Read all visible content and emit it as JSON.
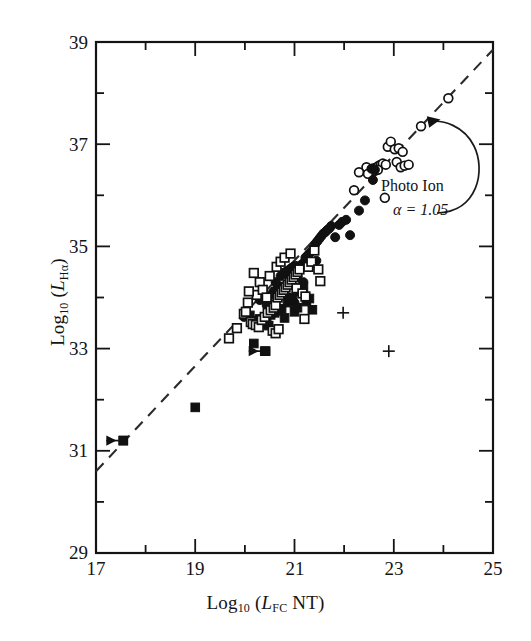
{
  "chart_data": {
    "type": "scatter",
    "title": "",
    "xlabel": "Log10 (LFC NT)",
    "ylabel": "Log10 (LHa)",
    "xlim": [
      17,
      25
    ],
    "ylim": [
      29,
      39
    ],
    "xticks_major": [
      17,
      19,
      21,
      23,
      25
    ],
    "xticks_minor": [
      18,
      20,
      22,
      24
    ],
    "yticks_major": [
      29,
      31,
      33,
      35,
      37,
      39
    ],
    "yticks_minor": [
      30,
      32,
      34,
      36,
      38
    ],
    "grid": false,
    "legend": "none",
    "annotations": [
      {
        "text_line1": "Photo Ion",
        "text_line2": "α = 1.05",
        "points_to": "fit-line",
        "arrow": "curved"
      }
    ],
    "fit_line": {
      "style": "dashed",
      "slope": 1.05,
      "label": "Photo Ion",
      "x_start": 17.0,
      "y_start": 30.6,
      "x_end": 25.0,
      "y_end": 38.85
    },
    "series": [
      {
        "name": "open-circles",
        "marker": "open-circle",
        "points": [
          [
            22.45,
            36.55
          ],
          [
            22.58,
            36.5
          ],
          [
            22.6,
            36.53
          ],
          [
            22.66,
            36.55
          ],
          [
            22.7,
            36.58
          ],
          [
            22.74,
            36.6
          ],
          [
            22.78,
            36.62
          ],
          [
            22.56,
            36.46
          ],
          [
            22.62,
            36.48
          ],
          [
            22.68,
            36.5
          ],
          [
            22.3,
            36.45
          ],
          [
            22.88,
            36.95
          ],
          [
            22.94,
            37.05
          ],
          [
            23.02,
            36.9
          ],
          [
            23.1,
            36.92
          ],
          [
            23.18,
            36.85
          ],
          [
            22.84,
            36.6
          ],
          [
            23.06,
            36.65
          ],
          [
            23.14,
            36.55
          ],
          [
            23.22,
            36.58
          ],
          [
            22.82,
            35.95
          ],
          [
            23.55,
            37.35
          ],
          [
            24.1,
            37.9
          ],
          [
            22.2,
            36.1
          ],
          [
            22.48,
            36.42
          ],
          [
            23.3,
            36.6
          ]
        ]
      },
      {
        "name": "filled-circles",
        "marker": "filled-circle",
        "points": [
          [
            20.3,
            33.95
          ],
          [
            20.62,
            34.3
          ],
          [
            20.72,
            34.42
          ],
          [
            20.78,
            34.48
          ],
          [
            20.82,
            34.5
          ],
          [
            20.86,
            34.52
          ],
          [
            20.9,
            34.55
          ],
          [
            20.94,
            34.58
          ],
          [
            20.98,
            34.6
          ],
          [
            21.02,
            34.62
          ],
          [
            21.06,
            34.4
          ],
          [
            21.1,
            34.2
          ],
          [
            21.14,
            34.1
          ],
          [
            21.18,
            34.3
          ],
          [
            21.22,
            34.78
          ],
          [
            21.26,
            34.82
          ],
          [
            21.3,
            34.86
          ],
          [
            21.34,
            34.9
          ],
          [
            21.38,
            34.95
          ],
          [
            21.42,
            35.05
          ],
          [
            21.46,
            35.1
          ],
          [
            21.5,
            35.15
          ],
          [
            21.54,
            35.2
          ],
          [
            21.58,
            35.25
          ],
          [
            21.62,
            35.28
          ],
          [
            21.66,
            35.32
          ],
          [
            21.7,
            35.35
          ],
          [
            21.74,
            35.4
          ],
          [
            21.82,
            35.18
          ],
          [
            21.9,
            35.42
          ],
          [
            21.96,
            35.48
          ],
          [
            22.04,
            35.52
          ],
          [
            22.12,
            35.22
          ],
          [
            22.3,
            35.7
          ],
          [
            22.42,
            35.9
          ],
          [
            22.58,
            36.3
          ],
          [
            21.4,
            34.68
          ],
          [
            21.44,
            34.72
          ],
          [
            21.12,
            34.62
          ],
          [
            21.16,
            34.66
          ],
          [
            20.52,
            34.05
          ],
          [
            20.58,
            34.12
          ],
          [
            20.66,
            34.18
          ],
          [
            20.7,
            34.22
          ],
          [
            19.98,
            33.62
          ],
          [
            20.44,
            33.85
          ],
          [
            20.88,
            34.0
          ],
          [
            21.0,
            33.9
          ],
          [
            22.55,
            36.52
          ],
          [
            22.62,
            36.5
          ]
        ]
      },
      {
        "name": "filled-squares",
        "marker": "filled-square",
        "points": [
          [
            17.55,
            31.2
          ],
          [
            19.0,
            31.85
          ],
          [
            20.4,
            32.95
          ],
          [
            20.18,
            33.1
          ],
          [
            20.22,
            33.55
          ],
          [
            20.3,
            33.58
          ],
          [
            20.44,
            33.62
          ],
          [
            20.52,
            33.66
          ],
          [
            20.6,
            33.7
          ],
          [
            20.66,
            33.74
          ],
          [
            20.74,
            33.78
          ],
          [
            20.8,
            33.6
          ],
          [
            20.86,
            33.9
          ],
          [
            20.92,
            33.95
          ],
          [
            20.96,
            34.0
          ],
          [
            21.0,
            33.72
          ],
          [
            21.06,
            33.8
          ],
          [
            21.12,
            34.12
          ],
          [
            21.18,
            34.18
          ],
          [
            21.24,
            33.92
          ],
          [
            21.3,
            33.98
          ],
          [
            20.1,
            33.65
          ],
          [
            20.34,
            33.48
          ],
          [
            20.48,
            33.45
          ],
          [
            20.7,
            34.05
          ],
          [
            21.36,
            33.76
          ]
        ]
      },
      {
        "name": "open-squares",
        "marker": "open-square",
        "points": [
          [
            19.68,
            33.2
          ],
          [
            19.98,
            33.68
          ],
          [
            20.02,
            33.72
          ],
          [
            20.06,
            33.9
          ],
          [
            20.12,
            33.52
          ],
          [
            20.16,
            33.48
          ],
          [
            20.22,
            33.46
          ],
          [
            20.28,
            33.42
          ],
          [
            20.34,
            33.56
          ],
          [
            20.4,
            33.62
          ],
          [
            20.46,
            33.7
          ],
          [
            20.52,
            33.75
          ],
          [
            20.58,
            33.8
          ],
          [
            20.62,
            33.85
          ],
          [
            20.66,
            34.0
          ],
          [
            20.7,
            34.05
          ],
          [
            20.74,
            34.1
          ],
          [
            20.78,
            34.15
          ],
          [
            20.82,
            34.2
          ],
          [
            20.86,
            34.25
          ],
          [
            20.9,
            34.3
          ],
          [
            20.94,
            34.35
          ],
          [
            20.98,
            34.4
          ],
          [
            21.02,
            34.45
          ],
          [
            21.06,
            34.5
          ],
          [
            21.1,
            34.55
          ],
          [
            20.3,
            34.3
          ],
          [
            20.5,
            34.42
          ],
          [
            20.64,
            34.6
          ],
          [
            20.72,
            34.7
          ],
          [
            20.8,
            34.78
          ],
          [
            20.92,
            34.86
          ],
          [
            21.04,
            34.18
          ],
          [
            21.16,
            34.08
          ],
          [
            21.22,
            34.02
          ],
          [
            21.28,
            34.6
          ],
          [
            21.34,
            34.7
          ],
          [
            20.24,
            34.05
          ],
          [
            20.36,
            34.15
          ],
          [
            20.44,
            34.0
          ],
          [
            21.4,
            34.92
          ],
          [
            21.48,
            34.55
          ],
          [
            20.18,
            34.48
          ],
          [
            20.08,
            34.12
          ],
          [
            20.56,
            33.35
          ],
          [
            20.62,
            33.3
          ],
          [
            20.68,
            33.38
          ],
          [
            21.2,
            33.58
          ],
          [
            21.52,
            34.32
          ],
          [
            19.84,
            33.4
          ]
        ]
      },
      {
        "name": "plus-markers",
        "marker": "plus",
        "points": [
          [
            21.98,
            33.7
          ],
          [
            22.9,
            32.95
          ]
        ]
      },
      {
        "name": "upper-limits",
        "marker": "filled-square-left-arrow",
        "points": [
          [
            17.55,
            31.2
          ],
          [
            20.42,
            32.95
          ]
        ]
      }
    ]
  },
  "axes": {
    "x_title_prefix": "Log",
    "x_title_sub": "10",
    "x_title_body_open": " (",
    "x_title_italic": "L",
    "x_title_italic_sub": "FC",
    "x_title_tail": " NT)",
    "y_title_prefix": "Log",
    "y_title_sub": "10",
    "y_title_body_open": " (",
    "y_title_italic": "L",
    "y_title_italic_sub": "Hα",
    "y_title_tail": ")"
  },
  "annotation": {
    "label": "Photo Ion",
    "alpha": "α = 1.05"
  },
  "colors": {
    "axis": "#141414",
    "marker_fill": "#111111",
    "marker_open": "#ffffff",
    "dashed_line": "#2b2b2b",
    "background": "#ffffff"
  }
}
